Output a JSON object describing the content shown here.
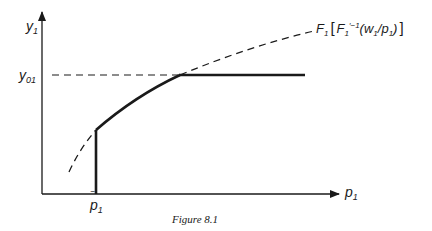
{
  "figure": {
    "caption": "Figure 8.1",
    "axes": {
      "y_label": "y",
      "y_label_sub": "1",
      "x_label": "p",
      "x_label_sub": "1"
    },
    "markers": {
      "y_level_label": "y",
      "y_level_sub": "01",
      "x_threshold_label": "p",
      "x_threshold_sub": "1",
      "x_threshold_bar": "‾"
    },
    "curve_label": {
      "prefix": "F",
      "prefix_sub": "1",
      "open_bracket": "[",
      "inner_f": "F",
      "inner_sub": "1",
      "inner_sup": "′−1",
      "args_open": "(w",
      "args_sub1": "1",
      "args_mid": "/p",
      "args_sub2": "1",
      "args_close": ")",
      "close_bracket": "]"
    },
    "colors": {
      "ink": "#1a1a1a",
      "background": "#ffffff"
    }
  }
}
